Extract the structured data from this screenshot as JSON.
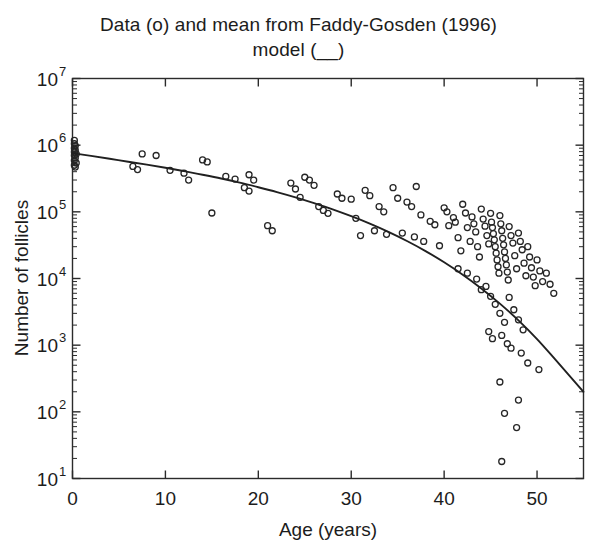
{
  "chart_data": {
    "type": "scatter",
    "title": "Data (o) and mean from Faddy-Gosden (1996) model (__)",
    "title_lines": [
      "Data (o) and mean from Faddy-Gosden (1996)",
      "model (__)"
    ],
    "xlabel": "Age (years)",
    "ylabel": "Number of follicles",
    "xlim": [
      0,
      55
    ],
    "ylim": [
      10,
      10000000
    ],
    "yscale": "log",
    "xscale": "linear",
    "grid": false,
    "legend": "none",
    "legend_note": "o = data points, solid line = Faddy-Gosden (1996) model mean",
    "xticks": [
      0,
      10,
      20,
      30,
      40,
      50
    ],
    "xtick_labels": [
      "0",
      "10",
      "20",
      "30",
      "40",
      "50"
    ],
    "yticks": [
      10,
      100,
      1000,
      10000,
      100000,
      1000000,
      10000000
    ],
    "ytick_labels": [
      "10^1",
      "10^2",
      "10^3",
      "10^4",
      "10^5",
      "10^6",
      "10^7"
    ],
    "ytick_mantissa": "10",
    "ytick_exponents": [
      "1",
      "2",
      "3",
      "4",
      "5",
      "6",
      "7"
    ],
    "marker": "circle-open",
    "marker_size": 6,
    "series": [
      {
        "name": "Model mean (Faddy-Gosden 1996)",
        "type": "line",
        "color": "#202020",
        "x": [
          0,
          2,
          4,
          6,
          8,
          10,
          12,
          14,
          16,
          18,
          20,
          22,
          24,
          26,
          28,
          30,
          32,
          34,
          36,
          38,
          40,
          42,
          44,
          46,
          48,
          50,
          52,
          55
        ],
        "y": [
          760000,
          690000,
          625000,
          565000,
          510000,
          458000,
          408000,
          360000,
          316000,
          274000,
          234000,
          198000,
          165000,
          135000,
          109000,
          86000,
          66500,
          50000,
          36500,
          25800,
          17500,
          11400,
          7100,
          4200,
          2350,
          1230,
          600,
          200
        ]
      },
      {
        "name": "Observed follicle counts",
        "type": "scatter",
        "color": "#262626",
        "points": [
          [
            0.2,
            1180000
          ],
          [
            0.2,
            1050000
          ],
          [
            0.3,
            980000
          ],
          [
            0.2,
            900000
          ],
          [
            0.3,
            840000
          ],
          [
            0.2,
            790000
          ],
          [
            0.4,
            740000
          ],
          [
            0.2,
            700000
          ],
          [
            0.3,
            640000
          ],
          [
            0.2,
            590000
          ],
          [
            0.4,
            540000
          ],
          [
            0.2,
            500000
          ],
          [
            0.3,
            470000
          ],
          [
            6.5,
            480000
          ],
          [
            7.0,
            430000
          ],
          [
            7.5,
            740000
          ],
          [
            9.0,
            700000
          ],
          [
            10.5,
            420000
          ],
          [
            12.0,
            380000
          ],
          [
            12.5,
            300000
          ],
          [
            14.0,
            600000
          ],
          [
            14.5,
            560000
          ],
          [
            15.0,
            96000
          ],
          [
            16.5,
            340000
          ],
          [
            17.5,
            310000
          ],
          [
            18.5,
            230000
          ],
          [
            19.0,
            360000
          ],
          [
            19.5,
            300000
          ],
          [
            19.0,
            205000
          ],
          [
            21.0,
            62000
          ],
          [
            21.5,
            52000
          ],
          [
            23.5,
            270000
          ],
          [
            24.0,
            220000
          ],
          [
            24.5,
            165000
          ],
          [
            25.0,
            330000
          ],
          [
            25.5,
            300000
          ],
          [
            26.0,
            250000
          ],
          [
            26.5,
            120000
          ],
          [
            27.0,
            105000
          ],
          [
            27.5,
            95000
          ],
          [
            28.5,
            185000
          ],
          [
            29.0,
            160000
          ],
          [
            30.0,
            155000
          ],
          [
            30.5,
            80000
          ],
          [
            31.0,
            44000
          ],
          [
            31.5,
            210000
          ],
          [
            32.0,
            175000
          ],
          [
            32.5,
            52000
          ],
          [
            33.0,
            120000
          ],
          [
            33.5,
            100000
          ],
          [
            33.8,
            46000
          ],
          [
            34.5,
            230000
          ],
          [
            35.0,
            160000
          ],
          [
            35.5,
            48000
          ],
          [
            36.0,
            140000
          ],
          [
            36.5,
            120000
          ],
          [
            36.8,
            42000
          ],
          [
            37.0,
            240000
          ],
          [
            37.5,
            90000
          ],
          [
            37.8,
            36000
          ],
          [
            38.5,
            72000
          ],
          [
            39.0,
            64000
          ],
          [
            39.5,
            31000
          ],
          [
            40.0,
            115000
          ],
          [
            40.3,
            100000
          ],
          [
            40.5,
            62000
          ],
          [
            41.0,
            82000
          ],
          [
            41.2,
            70000
          ],
          [
            41.5,
            41000
          ],
          [
            41.8,
            26000
          ],
          [
            42.0,
            130000
          ],
          [
            42.3,
            96000
          ],
          [
            42.5,
            58000
          ],
          [
            42.8,
            36000
          ],
          [
            43.0,
            84000
          ],
          [
            43.2,
            66000
          ],
          [
            43.4,
            50000
          ],
          [
            43.6,
            30000
          ],
          [
            43.8,
            21000
          ],
          [
            44.0,
            110000
          ],
          [
            44.2,
            78000
          ],
          [
            44.4,
            61000
          ],
          [
            44.6,
            44000
          ],
          [
            44.8,
            33000
          ],
          [
            45.0,
            95000
          ],
          [
            45.1,
            70000
          ],
          [
            45.2,
            58000
          ],
          [
            45.3,
            47000
          ],
          [
            45.4,
            38000
          ],
          [
            45.5,
            30000
          ],
          [
            45.6,
            24000
          ],
          [
            45.7,
            19000
          ],
          [
            45.8,
            15000
          ],
          [
            45.9,
            12000
          ],
          [
            46.0,
            88000
          ],
          [
            46.1,
            66000
          ],
          [
            46.2,
            52000
          ],
          [
            46.3,
            40000
          ],
          [
            46.4,
            32000
          ],
          [
            46.5,
            25000
          ],
          [
            46.6,
            20000
          ],
          [
            46.7,
            16000
          ],
          [
            46.8,
            12500
          ],
          [
            46.9,
            9500
          ],
          [
            47.0,
            60000
          ],
          [
            47.2,
            44000
          ],
          [
            47.4,
            34000
          ],
          [
            47.6,
            22000
          ],
          [
            47.8,
            14000
          ],
          [
            48.0,
            48000
          ],
          [
            48.2,
            36000
          ],
          [
            48.4,
            27000
          ],
          [
            48.6,
            17000
          ],
          [
            48.8,
            11000
          ],
          [
            49.0,
            30000
          ],
          [
            49.2,
            21000
          ],
          [
            49.4,
            14500
          ],
          [
            49.6,
            10500
          ],
          [
            49.8,
            7800
          ],
          [
            50.0,
            19000
          ],
          [
            50.3,
            13000
          ],
          [
            50.6,
            9000
          ],
          [
            51.0,
            12000
          ],
          [
            51.4,
            8200
          ],
          [
            51.8,
            6000
          ],
          [
            44.5,
            7600
          ],
          [
            45.0,
            5400
          ],
          [
            45.5,
            4100
          ],
          [
            46.0,
            3000
          ],
          [
            46.5,
            2200
          ],
          [
            47.0,
            5200
          ],
          [
            47.5,
            3400
          ],
          [
            48.0,
            2400
          ],
          [
            48.5,
            1700
          ],
          [
            43.5,
            9800
          ],
          [
            44.0,
            6800
          ],
          [
            42.5,
            12000
          ],
          [
            41.5,
            14000
          ],
          [
            46.2,
            1400
          ],
          [
            46.8,
            1050
          ],
          [
            45.2,
            1250
          ],
          [
            44.8,
            1600
          ],
          [
            47.2,
            900
          ],
          [
            48.3,
            760
          ],
          [
            49.0,
            540
          ],
          [
            50.2,
            430
          ],
          [
            46.0,
            280
          ],
          [
            48.0,
            150
          ],
          [
            46.5,
            95
          ],
          [
            47.8,
            58
          ],
          [
            46.2,
            18
          ]
        ]
      }
    ]
  },
  "figure": {
    "background": "#ffffff",
    "axis_color": "#2b2b2b",
    "text_color": "#1c1c1c"
  }
}
